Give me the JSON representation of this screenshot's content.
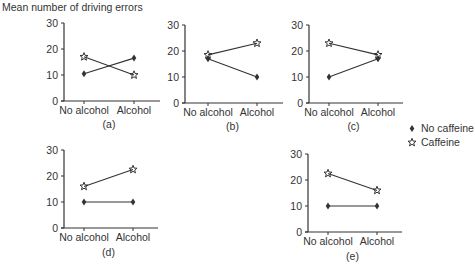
{
  "chart_data": [
    {
      "type": "line",
      "panel": "(a)",
      "title": "Mean number of driving errors",
      "categories": [
        "No alcohol",
        "Alcohol"
      ],
      "series": [
        {
          "name": "No caffeine",
          "marker": "diamond",
          "values": [
            10.5,
            16.5
          ]
        },
        {
          "name": "Caffeine",
          "marker": "star",
          "values": [
            17,
            10
          ]
        }
      ],
      "ylabel": "Mean number of driving errors",
      "xlabel": "",
      "ylim": [
        0,
        30
      ],
      "yticks": [
        0,
        10,
        20,
        30
      ],
      "grid": false
    },
    {
      "type": "line",
      "panel": "(b)",
      "categories": [
        "No alcohol",
        "Alcohol"
      ],
      "series": [
        {
          "name": "No caffeine",
          "marker": "diamond",
          "values": [
            17,
            10
          ]
        },
        {
          "name": "Caffeine",
          "marker": "star",
          "values": [
            18.5,
            23
          ]
        }
      ],
      "ylim": [
        0,
        30
      ],
      "yticks": [
        0,
        10,
        20,
        30
      ],
      "grid": false
    },
    {
      "type": "line",
      "panel": "(c)",
      "categories": [
        "No alcohol",
        "Alcohol"
      ],
      "series": [
        {
          "name": "No caffeine",
          "marker": "diamond",
          "values": [
            10,
            17
          ]
        },
        {
          "name": "Caffeine",
          "marker": "star",
          "values": [
            23,
            18.5
          ]
        }
      ],
      "ylim": [
        0,
        30
      ],
      "yticks": [
        0,
        10,
        20,
        30
      ],
      "grid": false
    },
    {
      "type": "line",
      "panel": "(d)",
      "categories": [
        "No alcohol",
        "Alcohol"
      ],
      "series": [
        {
          "name": "No caffeine",
          "marker": "diamond",
          "values": [
            10,
            10
          ]
        },
        {
          "name": "Caffeine",
          "marker": "star",
          "values": [
            16,
            22.5
          ]
        }
      ],
      "ylim": [
        0,
        30
      ],
      "yticks": [
        0,
        10,
        20,
        30
      ],
      "grid": false
    },
    {
      "type": "line",
      "panel": "(e)",
      "categories": [
        "No alcohol",
        "Alcohol"
      ],
      "series": [
        {
          "name": "No caffeine",
          "marker": "diamond",
          "values": [
            10,
            10
          ]
        },
        {
          "name": "Caffeine",
          "marker": "star",
          "values": [
            22.5,
            16
          ]
        }
      ],
      "ylim": [
        0,
        30
      ],
      "yticks": [
        0,
        10,
        20,
        30
      ],
      "grid": false
    }
  ],
  "figure": {
    "title": "Mean number of driving errors",
    "legend": {
      "position": "right",
      "items": [
        {
          "label": "No caffeine",
          "marker": "diamond"
        },
        {
          "label": "Caffeine",
          "marker": "star"
        }
      ]
    },
    "colors": {
      "ink": "#333333",
      "background": "#ffffff"
    }
  },
  "layout": {
    "panels": [
      {
        "axis_x": 64,
        "y_top": 23,
        "y_bottom": 101,
        "x1": 84,
        "x2": 134,
        "x_end": 160,
        "label_y": 128
      },
      {
        "axis_x": 185,
        "y_top": 25,
        "y_bottom": 103,
        "x1": 208,
        "x2": 257,
        "x_end": 283,
        "label_y": 130
      },
      {
        "axis_x": 309,
        "y_top": 25,
        "y_bottom": 103,
        "x1": 329,
        "x2": 378,
        "x_end": 403,
        "label_y": 130
      },
      {
        "axis_x": 64,
        "y_top": 150,
        "y_bottom": 228,
        "x1": 84,
        "x2": 133,
        "x_end": 158,
        "label_y": 256
      },
      {
        "axis_x": 308,
        "y_top": 154,
        "y_bottom": 232,
        "x1": 328,
        "x2": 377,
        "x_end": 402,
        "label_y": 260
      }
    ]
  }
}
